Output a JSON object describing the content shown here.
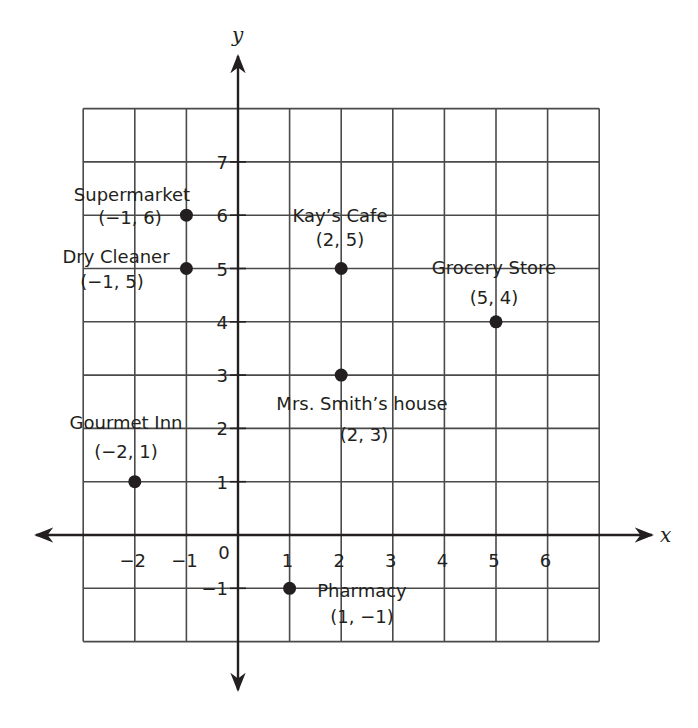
{
  "chart_data": {
    "type": "scatter",
    "title": "",
    "xlabel": "x",
    "ylabel": "y",
    "xlim": [
      -3,
      7
    ],
    "ylim": [
      -2,
      8
    ],
    "grid": true,
    "x_ticks": [
      -2,
      -1,
      0,
      1,
      2,
      3,
      4,
      5,
      6
    ],
    "x_tick_labels": [
      "−2",
      "−1",
      "0",
      "1",
      "2",
      "3",
      "4",
      "5",
      "6"
    ],
    "y_ticks": [
      -1,
      1,
      2,
      3,
      4,
      5,
      6,
      7
    ],
    "y_tick_labels": [
      "−1",
      "1",
      "2",
      "3",
      "4",
      "5",
      "6",
      "7"
    ],
    "points": [
      {
        "name": "Supermarket",
        "coord_label": "(−1, 6)",
        "x": -1,
        "y": 6
      },
      {
        "name": "Dry Cleaner",
        "coord_label": "(−1, 5)",
        "x": -1,
        "y": 5
      },
      {
        "name": "Kay’s Cafe",
        "coord_label": "(2, 5)",
        "x": 2,
        "y": 5
      },
      {
        "name": "Grocery Store",
        "coord_label": "(5, 4)",
        "x": 5,
        "y": 4
      },
      {
        "name": "Mrs. Smith’s house",
        "coord_label": "(2, 3)",
        "x": 2,
        "y": 3
      },
      {
        "name": "Gourmet Inn",
        "coord_label": "(−2, 1)",
        "x": -2,
        "y": 1
      },
      {
        "name": "Pharmacy",
        "coord_label": "(1, −1)",
        "x": 1,
        "y": -1
      }
    ],
    "colors": {
      "ink": "#231f20",
      "grid": "#4a4a4a",
      "background": "#ffffff"
    }
  }
}
